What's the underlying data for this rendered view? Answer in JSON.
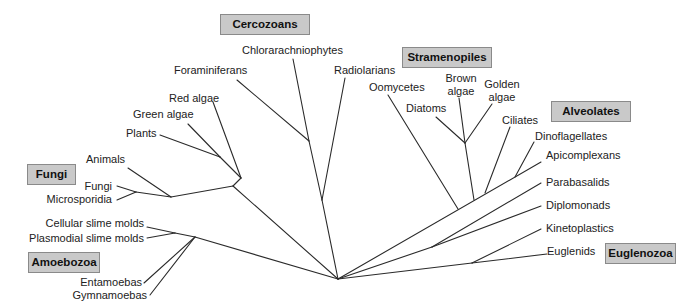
{
  "diagram": {
    "type": "unrooted phylogenetic tree of eukaryotes",
    "line_color": "#2a2a2a",
    "box_fill": "#c9c9c9",
    "box_border": "#8a8a8a"
  },
  "groups": {
    "cercozoans": "Cercozoans",
    "stramenopiles": "Stramenopiles",
    "alveolates": "Alveolates",
    "fungi": "Fungi",
    "amoebozoa": "Amoebozoa",
    "euglenozoa": "Euglenozoa"
  },
  "taxa": {
    "chlorarachniophytes": "Chlorarachniophytes",
    "foraminiferans": "Foraminiferans",
    "radiolarians": "Radiolarians",
    "red_algae": "Red algae",
    "green_algae": "Green algae",
    "plants": "Plants",
    "animals": "Animals",
    "fungi": "Fungi",
    "microsporidia": "Microsporidia",
    "cellular_slime_molds": "Cellular slime molds",
    "plasmodial_slime_molds": "Plasmodial slime molds",
    "entamoebas": "Entamoebas",
    "gymnamoebas": "Gymnamoebas",
    "oomycetes": "Oomycetes",
    "brown_algae_1": "Brown",
    "brown_algae_2": "algae",
    "golden_algae_1": "Golden",
    "golden_algae_2": "algae",
    "diatoms": "Diatoms",
    "ciliates": "Ciliates",
    "dinoflagellates": "Dinoflagellates",
    "apicomplexans": "Apicomplexans",
    "parabasalids": "Parabasalids",
    "diplomonads": "Diplomonads",
    "kinetoplastics": "Kinetoplastics",
    "euglenids": "Euglenids"
  }
}
